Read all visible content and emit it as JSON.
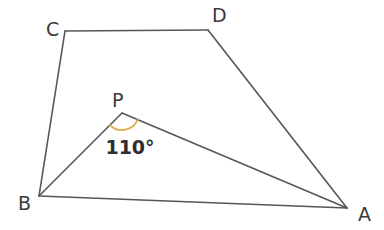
{
  "figure": {
    "background_color": "#ffffff",
    "stroke_color": "#54565a",
    "stroke_width": 1.6,
    "label_color": "#3b3b3b",
    "arc_color": "#dfa94a",
    "arc_width": 1.8,
    "arc_radius": 17,
    "width": 384,
    "height": 230
  },
  "vertices": {
    "A": {
      "label": "A",
      "x": 347,
      "y": 208,
      "label_x": 358,
      "label_y": 221
    },
    "B": {
      "label": "B",
      "x": 39,
      "y": 196,
      "label_x": 18,
      "label_y": 210
    },
    "C": {
      "label": "C",
      "x": 65,
      "y": 31,
      "label_x": 46,
      "label_y": 36
    },
    "D": {
      "label": "D",
      "x": 208,
      "y": 30,
      "label_x": 212,
      "label_y": 22
    },
    "P": {
      "label": "P",
      "x": 122,
      "y": 113,
      "label_x": 112,
      "label_y": 107
    }
  },
  "segments": [
    {
      "name": "segment-CD",
      "from": "C",
      "to": "D",
      "x1": 65,
      "y1": 31,
      "x2": 208,
      "y2": 30
    },
    {
      "name": "segment-DA",
      "from": "D",
      "to": "A",
      "x1": 208,
      "y1": 30,
      "x2": 347,
      "y2": 208
    },
    {
      "name": "segment-AB",
      "from": "A",
      "to": "B",
      "x1": 347,
      "y1": 208,
      "x2": 39,
      "y2": 196
    },
    {
      "name": "segment-BC",
      "from": "B",
      "to": "C",
      "x1": 39,
      "y1": 196,
      "x2": 65,
      "y2": 31
    },
    {
      "name": "segment-BP",
      "from": "B",
      "to": "P",
      "x1": 39,
      "y1": 196,
      "x2": 122,
      "y2": 113
    },
    {
      "name": "segment-PA",
      "from": "P",
      "to": "A",
      "x1": 122,
      "y1": 113,
      "x2": 347,
      "y2": 208
    }
  ],
  "angle_marks": [
    {
      "name": "angle-BPA",
      "vertex": "P",
      "value": "110°",
      "measure": 110,
      "unit": "degrees",
      "text_x": 130,
      "text_y": 154,
      "arc_path": "M 134.50 125.50 A 17 17 0 0 1 110.00 125.00"
    }
  ],
  "chart_data": {
    "type": "diagram",
    "points": [
      {
        "name": "A",
        "x": 347,
        "y": 208
      },
      {
        "name": "B",
        "x": 39,
        "y": 196
      },
      {
        "name": "C",
        "x": 65,
        "y": 31
      },
      {
        "name": "D",
        "x": 208,
        "y": 30
      },
      {
        "name": "P",
        "x": 122,
        "y": 113
      }
    ],
    "edges": [
      "C-D",
      "D-A",
      "A-B",
      "B-C",
      "B-P",
      "P-A"
    ],
    "annotations": [
      {
        "at": "P",
        "text": "110°"
      }
    ]
  }
}
